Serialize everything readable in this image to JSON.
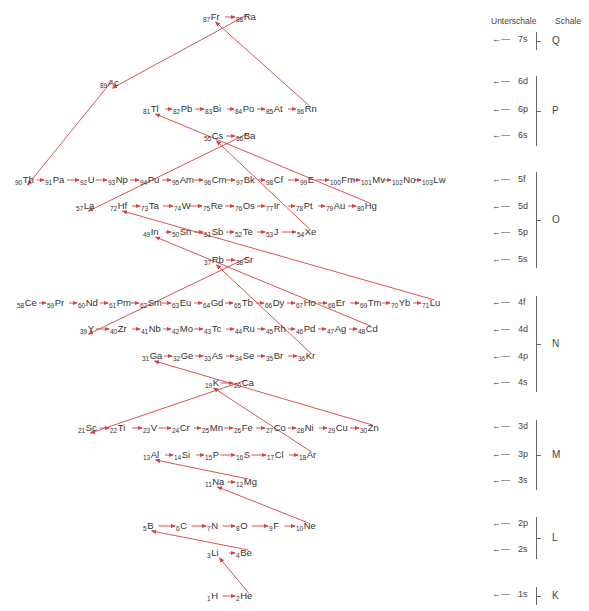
{
  "headers": {
    "subshell": "Unterschale",
    "shell": "Schale"
  },
  "colors": {
    "arrow": "#d94040",
    "text": "#333333",
    "brace": "#666666"
  },
  "elements": [
    {
      "z": "87",
      "s": "Fr",
      "x": 203,
      "y": 12
    },
    {
      "z": "88",
      "s": "Ra",
      "x": 236,
      "y": 12
    },
    {
      "z": "89",
      "s": "Ac",
      "x": 100,
      "y": 78
    },
    {
      "z": "81",
      "s": "Tl",
      "x": 143,
      "y": 104
    },
    {
      "z": "82",
      "s": "Pb",
      "x": 173,
      "y": 104
    },
    {
      "z": "83",
      "s": "Bi",
      "x": 205,
      "y": 104
    },
    {
      "z": "84",
      "s": "Po",
      "x": 235,
      "y": 104
    },
    {
      "z": "85",
      "s": "At",
      "x": 266,
      "y": 104
    },
    {
      "z": "86",
      "s": "Rn",
      "x": 297,
      "y": 104
    },
    {
      "z": "55",
      "s": "Cs",
      "x": 204,
      "y": 131
    },
    {
      "z": "56",
      "s": "Ba",
      "x": 236,
      "y": 131
    },
    {
      "z": "90",
      "s": "Th",
      "x": 15,
      "y": 175
    },
    {
      "z": "91",
      "s": "Pa",
      "x": 45,
      "y": 175
    },
    {
      "z": "92",
      "s": "U",
      "x": 80,
      "y": 175
    },
    {
      "z": "93",
      "s": "Np",
      "x": 108,
      "y": 175
    },
    {
      "z": "94",
      "s": "Pu",
      "x": 140,
      "y": 175
    },
    {
      "z": "95",
      "s": "Am",
      "x": 172,
      "y": 175
    },
    {
      "z": "96",
      "s": "Cm",
      "x": 204,
      "y": 175
    },
    {
      "z": "97",
      "s": "Bk",
      "x": 236,
      "y": 175
    },
    {
      "z": "98",
      "s": "Cf",
      "x": 266,
      "y": 175
    },
    {
      "z": "99",
      "s": "E",
      "x": 300,
      "y": 175
    },
    {
      "z": "100",
      "s": "Fm",
      "x": 330,
      "y": 175
    },
    {
      "z": "101",
      "s": "Mv",
      "x": 361,
      "y": 175
    },
    {
      "z": "102",
      "s": "No",
      "x": 392,
      "y": 175
    },
    {
      "z": "103",
      "s": "Lw",
      "x": 422,
      "y": 175
    },
    {
      "z": "57",
      "s": "La",
      "x": 76,
      "y": 201
    },
    {
      "z": "72",
      "s": "Hf",
      "x": 110,
      "y": 201
    },
    {
      "z": "73",
      "s": "Ta",
      "x": 141,
      "y": 201
    },
    {
      "z": "74",
      "s": "W",
      "x": 174,
      "y": 201
    },
    {
      "z": "75",
      "s": "Re",
      "x": 203,
      "y": 201
    },
    {
      "z": "76",
      "s": "Os",
      "x": 235,
      "y": 201
    },
    {
      "z": "77",
      "s": "Ir",
      "x": 266,
      "y": 201
    },
    {
      "z": "78",
      "s": "Pt",
      "x": 296,
      "y": 201
    },
    {
      "z": "79",
      "s": "Au",
      "x": 326,
      "y": 201
    },
    {
      "z": "80",
      "s": "Hg",
      "x": 357,
      "y": 201
    },
    {
      "z": "49",
      "s": "In",
      "x": 143,
      "y": 227
    },
    {
      "z": "50",
      "s": "Sn",
      "x": 172,
      "y": 227
    },
    {
      "z": "51",
      "s": "Sb",
      "x": 204,
      "y": 227
    },
    {
      "z": "52",
      "s": "Te",
      "x": 235,
      "y": 227
    },
    {
      "z": "53",
      "s": "J",
      "x": 266,
      "y": 227
    },
    {
      "z": "54",
      "s": "Xe",
      "x": 297,
      "y": 227
    },
    {
      "z": "37",
      "s": "Rb",
      "x": 204,
      "y": 255
    },
    {
      "z": "38",
      "s": "Sr",
      "x": 236,
      "y": 255
    },
    {
      "z": "58",
      "s": "Ce",
      "x": 17,
      "y": 298
    },
    {
      "z": "59",
      "s": "Pr",
      "x": 47,
      "y": 298
    },
    {
      "z": "60",
      "s": "Nd",
      "x": 78,
      "y": 298
    },
    {
      "z": "61",
      "s": "Pm",
      "x": 109,
      "y": 298
    },
    {
      "z": "62",
      "s": "Sm",
      "x": 140,
      "y": 298
    },
    {
      "z": "63",
      "s": "Eu",
      "x": 172,
      "y": 298
    },
    {
      "z": "64",
      "s": "Gd",
      "x": 203,
      "y": 298
    },
    {
      "z": "65",
      "s": "Tb",
      "x": 234,
      "y": 298
    },
    {
      "z": "66",
      "s": "Dy",
      "x": 265,
      "y": 298
    },
    {
      "z": "67",
      "s": "Ho",
      "x": 296,
      "y": 298
    },
    {
      "z": "68",
      "s": "Er",
      "x": 328,
      "y": 298
    },
    {
      "z": "69",
      "s": "Tm",
      "x": 360,
      "y": 298
    },
    {
      "z": "70",
      "s": "Yb",
      "x": 391,
      "y": 298
    },
    {
      "z": "71",
      "s": "Lu",
      "x": 422,
      "y": 298
    },
    {
      "z": "39",
      "s": "Y",
      "x": 80,
      "y": 324
    },
    {
      "z": "40",
      "s": "Zr",
      "x": 110,
      "y": 324
    },
    {
      "z": "41",
      "s": "Nb",
      "x": 141,
      "y": 324
    },
    {
      "z": "42",
      "s": "Mo",
      "x": 172,
      "y": 324
    },
    {
      "z": "43",
      "s": "Tc",
      "x": 204,
      "y": 324
    },
    {
      "z": "44",
      "s": "Ru",
      "x": 235,
      "y": 324
    },
    {
      "z": "45",
      "s": "Rh",
      "x": 266,
      "y": 324
    },
    {
      "z": "46",
      "s": "Pd",
      "x": 296,
      "y": 324
    },
    {
      "z": "47",
      "s": "Ag",
      "x": 327,
      "y": 324
    },
    {
      "z": "48",
      "s": "Cd",
      "x": 358,
      "y": 324
    },
    {
      "z": "31",
      "s": "Ga",
      "x": 142,
      "y": 351
    },
    {
      "z": "32",
      "s": "Ge",
      "x": 173,
      "y": 351
    },
    {
      "z": "33",
      "s": "As",
      "x": 204,
      "y": 351
    },
    {
      "z": "34",
      "s": "Se",
      "x": 235,
      "y": 351
    },
    {
      "z": "35",
      "s": "Br",
      "x": 266,
      "y": 351
    },
    {
      "z": "36",
      "s": "Kr",
      "x": 298,
      "y": 351
    },
    {
      "z": "19",
      "s": "K",
      "x": 205,
      "y": 378
    },
    {
      "z": "20",
      "s": "Ca",
      "x": 234,
      "y": 378
    },
    {
      "z": "21",
      "s": "Sc",
      "x": 78,
      "y": 423
    },
    {
      "z": "22",
      "s": "Ti",
      "x": 110,
      "y": 423
    },
    {
      "z": "23",
      "s": "V",
      "x": 143,
      "y": 423
    },
    {
      "z": "24",
      "s": "Cr",
      "x": 172,
      "y": 423
    },
    {
      "z": "25",
      "s": "Mn",
      "x": 202,
      "y": 423
    },
    {
      "z": "26",
      "s": "Fe",
      "x": 234,
      "y": 423
    },
    {
      "z": "27",
      "s": "Co",
      "x": 266,
      "y": 423
    },
    {
      "z": "28",
      "s": "Ni",
      "x": 297,
      "y": 423
    },
    {
      "z": "29",
      "s": "Cu",
      "x": 328,
      "y": 423
    },
    {
      "z": "30",
      "s": "Zn",
      "x": 360,
      "y": 423
    },
    {
      "z": "13",
      "s": "Al",
      "x": 143,
      "y": 450
    },
    {
      "z": "14",
      "s": "Si",
      "x": 174,
      "y": 450
    },
    {
      "z": "15",
      "s": "P",
      "x": 205,
      "y": 450
    },
    {
      "z": "16",
      "s": "S",
      "x": 236,
      "y": 450
    },
    {
      "z": "17",
      "s": "Cl",
      "x": 267,
      "y": 450
    },
    {
      "z": "18",
      "s": "Ar",
      "x": 299,
      "y": 450
    },
    {
      "z": "11",
      "s": "Na",
      "x": 205,
      "y": 477
    },
    {
      "z": "12",
      "s": "Mg",
      "x": 236,
      "y": 477
    },
    {
      "z": "5",
      "s": "B",
      "x": 143,
      "y": 521
    },
    {
      "z": "6",
      "s": "C",
      "x": 176,
      "y": 521
    },
    {
      "z": "7",
      "s": "N",
      "x": 207,
      "y": 521
    },
    {
      "z": "8",
      "s": "O",
      "x": 236,
      "y": 521
    },
    {
      "z": "9",
      "s": "F",
      "x": 269,
      "y": 521
    },
    {
      "z": "10",
      "s": "Ne",
      "x": 296,
      "y": 521
    },
    {
      "z": "3",
      "s": "Li",
      "x": 207,
      "y": 548
    },
    {
      "z": "4",
      "s": "Be",
      "x": 236,
      "y": 548
    },
    {
      "z": "1",
      "s": "H",
      "x": 207,
      "y": 591
    },
    {
      "z": "2",
      "s": "He",
      "x": 236,
      "y": 591
    }
  ],
  "subshells": [
    {
      "label": "7s",
      "y": 40
    },
    {
      "label": "6d",
      "y": 82
    },
    {
      "label": "6p",
      "y": 110
    },
    {
      "label": "6s",
      "y": 136
    },
    {
      "label": "5f",
      "y": 180
    },
    {
      "label": "5d",
      "y": 207
    },
    {
      "label": "5p",
      "y": 233
    },
    {
      "label": "5s",
      "y": 260
    },
    {
      "label": "4f",
      "y": 303
    },
    {
      "label": "4d",
      "y": 330
    },
    {
      "label": "4p",
      "y": 357
    },
    {
      "label": "4s",
      "y": 383
    },
    {
      "label": "3d",
      "y": 427
    },
    {
      "label": "3p",
      "y": 455
    },
    {
      "label": "3s",
      "y": 481
    },
    {
      "label": "2p",
      "y": 524
    },
    {
      "label": "2s",
      "y": 550
    },
    {
      "label": "1s",
      "y": 595
    }
  ],
  "shells": [
    {
      "label": "Q",
      "top": 32,
      "bottom": 50
    },
    {
      "label": "P",
      "top": 76,
      "bottom": 146
    },
    {
      "label": "O",
      "top": 172,
      "bottom": 268
    },
    {
      "label": "N",
      "top": 296,
      "bottom": 392
    },
    {
      "label": "M",
      "top": 420,
      "bottom": 490
    },
    {
      "label": "L",
      "top": 517,
      "bottom": 559
    },
    {
      "label": "K",
      "top": 587,
      "bottom": 605
    }
  ],
  "diagonals": [
    [
      "2",
      "3"
    ],
    [
      "4",
      "5"
    ],
    [
      "10",
      "11"
    ],
    [
      "12",
      "13"
    ],
    [
      "18",
      "19"
    ],
    [
      "20",
      "21"
    ],
    [
      "30",
      "31"
    ],
    [
      "36",
      "37"
    ],
    [
      "38",
      "39"
    ],
    [
      "48",
      "49"
    ],
    [
      "54",
      "55"
    ],
    [
      "56",
      "57"
    ],
    [
      "71",
      "72"
    ],
    [
      "80",
      "81"
    ],
    [
      "86",
      "87"
    ],
    [
      "88",
      "89"
    ],
    [
      "89",
      "90"
    ]
  ]
}
